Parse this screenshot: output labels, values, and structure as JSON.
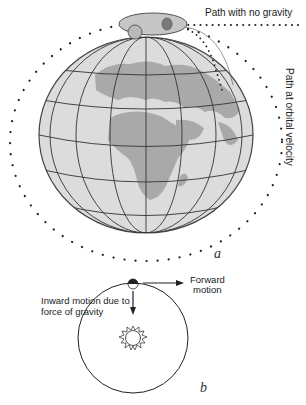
{
  "figure": {
    "panel_a": {
      "letter": "a",
      "label_no_gravity": "Path with no gravity",
      "label_orbital": "Path at orbital velocity"
    },
    "panel_b": {
      "letter": "b",
      "label_forward": [
        "Forward",
        "motion"
      ],
      "label_inward": [
        "Inward motion due to",
        "force of gravity"
      ]
    }
  },
  "colors": {
    "ink": "#222222",
    "globe_ocean": "#d9d9d9",
    "globe_land": "#a8a8a8",
    "satellite": "#c4c4c4",
    "satellite_dark": "#7a7a7a"
  }
}
